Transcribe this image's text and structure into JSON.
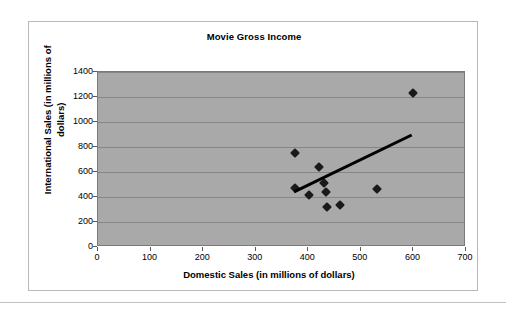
{
  "chart_data": {
    "type": "scatter",
    "title": "Movie Gross Income",
    "xlabel": "Domestic Sales (in millions of dollars)",
    "ylabel": "International Sales (in millions of dollars)",
    "xlim": [
      0,
      700
    ],
    "ylim": [
      0,
      1400
    ],
    "xticks": [
      0,
      100,
      200,
      300,
      400,
      500,
      600,
      700
    ],
    "yticks": [
      0,
      200,
      400,
      600,
      800,
      1000,
      1200,
      1400
    ],
    "grid": "horizontal",
    "legend": "none",
    "plot_background": "#a9a9a9",
    "marker_color": "#1a1a1a",
    "marker_shape": "diamond",
    "trendline_color": "#000000",
    "series": [
      {
        "name": "Movies",
        "points": [
          {
            "x": 375,
            "y": 750
          },
          {
            "x": 375,
            "y": 470
          },
          {
            "x": 402,
            "y": 420
          },
          {
            "x": 420,
            "y": 640
          },
          {
            "x": 430,
            "y": 510
          },
          {
            "x": 433,
            "y": 440
          },
          {
            "x": 435,
            "y": 320
          },
          {
            "x": 460,
            "y": 340
          },
          {
            "x": 531,
            "y": 465
          },
          {
            "x": 600,
            "y": 1235
          }
        ]
      }
    ],
    "trendline": {
      "name": "Linear trendline",
      "x_start": 375,
      "y_start": 430,
      "x_end": 600,
      "y_end": 890
    }
  }
}
